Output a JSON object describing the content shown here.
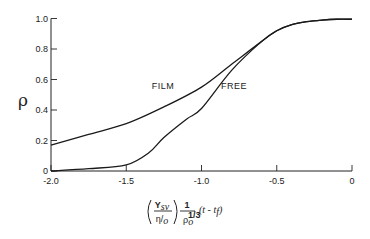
{
  "chart_data": {
    "type": "line",
    "title": "",
    "ylabel": "ρ",
    "xlabel": {
      "paren_numerator": "Y",
      "paren_numerator_sub": "sv",
      "paren_denominator": "η/",
      "paren_denominator_sub": "o",
      "frac_numerator": "1",
      "frac_denominator": "ρ",
      "frac_denominator_sub": "o",
      "frac_denominator_sup": "1/3",
      "tail": "(t - t",
      "tail_sub": "f",
      "tail_close": ")"
    },
    "xlim": [
      -2.0,
      0
    ],
    "ylim": [
      0,
      1.0
    ],
    "x_ticks": [
      -2.0,
      -1.5,
      -1.0,
      -0.5,
      0
    ],
    "x_tick_labels": [
      "-2.0",
      "-1.5",
      "-1.0",
      "-0.5",
      "0"
    ],
    "y_ticks": [
      0,
      0.2,
      0.4,
      0.6,
      0.8,
      1.0
    ],
    "y_tick_labels": [
      "0",
      "0.2",
      "0.4",
      "0.6",
      "0.8",
      "1.0"
    ],
    "grid": false,
    "series": [
      {
        "name": "FILM",
        "x": [
          -2.0,
          -1.75,
          -1.5,
          -1.25,
          -1.0,
          -0.8,
          -0.6,
          -0.5,
          -0.4,
          -0.3,
          -0.2,
          -0.1,
          0
        ],
        "y": [
          0.17,
          0.24,
          0.31,
          0.42,
          0.55,
          0.7,
          0.85,
          0.92,
          0.96,
          0.98,
          0.99,
          0.995,
          0.995
        ]
      },
      {
        "name": "FREE",
        "x": [
          -2.0,
          -1.75,
          -1.5,
          -1.35,
          -1.25,
          -1.1,
          -1.0,
          -0.8,
          -0.6,
          -0.5,
          -0.4,
          -0.3,
          -0.2,
          -0.1,
          0
        ],
        "y": [
          0.0,
          0.015,
          0.04,
          0.12,
          0.22,
          0.34,
          0.41,
          0.66,
          0.85,
          0.92,
          0.96,
          0.98,
          0.99,
          0.995,
          0.995
        ]
      }
    ],
    "annotations": [
      {
        "text": "FILM",
        "x": -1.33,
        "y": 0.54
      },
      {
        "text": "FREE",
        "x": -0.87,
        "y": 0.54
      }
    ]
  }
}
